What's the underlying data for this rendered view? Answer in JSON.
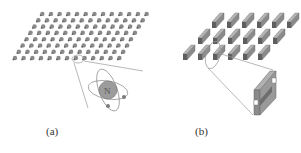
{
  "figure": {
    "panels": [
      {
        "id": "a",
        "label": "(a)",
        "description": "Lattice of atom-like particles arranged in a parallelogram, with magnified view of one particle as an atom with orbitals",
        "lattice": {
          "rows": 8,
          "cols": 13,
          "element": "atom"
        },
        "inset": {
          "element": "atom",
          "nucleus_label": "N"
        }
      },
      {
        "id": "b",
        "label": "(b)",
        "description": "Lattice of rod-like meta-atoms arranged in three staggered rows, with magnified view of one H-shaped bar element",
        "lattice": {
          "rows": 3,
          "cols": 6,
          "element": "bar"
        },
        "inset": {
          "element": "H-shaped bar"
        }
      }
    ],
    "colors": {
      "element_fill": "#8a8a8a",
      "element_dark": "#5e5e5e",
      "element_light": "#b5b5b5",
      "line": "#9a9a9a",
      "text": "#333333"
    }
  }
}
